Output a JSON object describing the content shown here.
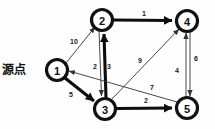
{
  "diagram": {
    "source_label": "源点",
    "nodes": [
      {
        "id": "1",
        "label": "1",
        "cx": 57,
        "cy": 70,
        "r": 11
      },
      {
        "id": "2",
        "label": "2",
        "cx": 102,
        "cy": 20,
        "r": 11
      },
      {
        "id": "3",
        "label": "3",
        "cx": 105,
        "cy": 109,
        "r": 11
      },
      {
        "id": "4",
        "label": "4",
        "cx": 187,
        "cy": 21,
        "r": 11
      },
      {
        "id": "5",
        "label": "5",
        "cx": 187,
        "cy": 108,
        "r": 11
      }
    ],
    "edges": [
      {
        "id": "e-1-2",
        "from": "1",
        "to": "2",
        "weight": "10",
        "style": "thin",
        "lx": 74,
        "ly": 41
      },
      {
        "id": "e-1-3",
        "from": "1",
        "to": "3",
        "weight": "5",
        "style": "bold",
        "lx": 71,
        "ly": 94
      },
      {
        "id": "e-2-4",
        "from": "2",
        "to": "4",
        "weight": "1",
        "style": "bold",
        "lx": 144,
        "ly": 13
      },
      {
        "id": "e-2-3",
        "from": "2",
        "to": "3",
        "weight": "2",
        "style": "thin",
        "lx": 95,
        "ly": 66
      },
      {
        "id": "e-3-2",
        "from": "3",
        "to": "2",
        "weight": "3",
        "style": "bold",
        "lx": 109,
        "ly": 66
      },
      {
        "id": "e-3-4",
        "from": "3",
        "to": "4",
        "weight": "9",
        "style": "thin",
        "lx": 140,
        "ly": 60
      },
      {
        "id": "e-3-5",
        "from": "3",
        "to": "5",
        "weight": "2",
        "style": "bold",
        "lx": 146,
        "ly": 100
      },
      {
        "id": "e-5-1",
        "from": "5",
        "to": "1",
        "weight": "7",
        "style": "thin",
        "lx": 152,
        "ly": 87
      },
      {
        "id": "e-4-5",
        "from": "4",
        "to": "5",
        "weight": "6",
        "style": "thin",
        "lx": 196,
        "ly": 58
      },
      {
        "id": "e-5-4",
        "from": "5",
        "to": "4",
        "weight": "4",
        "style": "thin",
        "lx": 177,
        "ly": 70
      }
    ],
    "colors": {
      "background": "#ffffff",
      "node_stroke": "#111111",
      "node_fill": "#ffffff",
      "edge_thin": "#333333",
      "edge_bold": "#0d0d0d",
      "text": "#111111"
    }
  }
}
